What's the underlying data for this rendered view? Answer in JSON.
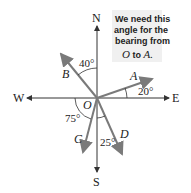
{
  "diagram": {
    "type": "compass-bearing",
    "compass": {
      "north": "N",
      "south": "S",
      "east": "E",
      "west": "W"
    },
    "origin": "O",
    "rays": [
      {
        "label": "A",
        "angle_label": "20°",
        "description": "20° above east"
      },
      {
        "label": "B",
        "angle_label": "40°",
        "description": "40° west of north"
      },
      {
        "label": "C",
        "angle_label": "75°",
        "description": "75° below west"
      },
      {
        "label": "D",
        "angle_label": "25°",
        "description": "25° east of south"
      }
    ],
    "callout": {
      "line1": "We need this",
      "line2": "angle for the",
      "line3": "bearing from",
      "line4_o": "O",
      "line4_to": " to ",
      "line4_a": "A."
    },
    "colors": {
      "axis": "#333333",
      "ray": "#7a7a7a",
      "callout_bg": "#f0f0f0"
    }
  }
}
